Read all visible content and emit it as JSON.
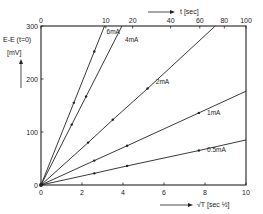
{
  "chart_data": {
    "type": "line",
    "title": "",
    "xlabel": "√T [sec½]",
    "ylabel": "E-E (t=0) [mV]",
    "x2label": "t [sec]",
    "xlim": [
      0,
      10
    ],
    "ylim": [
      0,
      300
    ],
    "x_ticks": [
      0,
      2,
      4,
      6,
      8,
      10
    ],
    "x_tick_labels": [
      "0",
      "2",
      "4",
      "6",
      "8",
      "10"
    ],
    "y_ticks": [
      0,
      100,
      200,
      300
    ],
    "y_tick_labels": [
      "0",
      "100",
      "200",
      "300"
    ],
    "x2_ticks": [
      0,
      10,
      20,
      40,
      60,
      80,
      100
    ],
    "x2_tick_labels": [
      "0",
      "10",
      "20",
      "40",
      "60",
      "80",
      "100"
    ],
    "grid": false,
    "legend": "inline labels",
    "series": [
      {
        "name": "6mA",
        "slope": 97,
        "x": [
          0,
          1.6,
          2.6,
          3.1
        ],
        "y": [
          0,
          155,
          252,
          300
        ],
        "label_pos": [
          3.2,
          285
        ]
      },
      {
        "name": "4mA",
        "slope": 76,
        "x": [
          0,
          1.5,
          2.2,
          3.95
        ],
        "y": [
          0,
          114,
          167,
          300
        ],
        "label_pos": [
          4.1,
          270
        ]
      },
      {
        "name": "2mA",
        "slope": 35,
        "x": [
          0,
          2.3,
          3.5,
          5.2,
          8.5
        ],
        "y": [
          0,
          80,
          123,
          182,
          300
        ],
        "label_pos": [
          5.6,
          190
        ]
      },
      {
        "name": "1mA",
        "slope": 17.7,
        "x": [
          0,
          2.6,
          4.2,
          7.7,
          10
        ],
        "y": [
          0,
          46,
          74,
          136,
          177
        ],
        "label_pos": [
          8.1,
          133
        ]
      },
      {
        "name": "0.5mA",
        "slope": 8.5,
        "x": [
          0,
          2.6,
          4.2,
          7.7,
          10
        ],
        "y": [
          0,
          22,
          36,
          65,
          85
        ],
        "label_pos": [
          8.1,
          62
        ]
      }
    ]
  },
  "labels": {
    "ylabel_line1": "E-E (t=0)",
    "ylabel_line2": "[mV]",
    "xlabel": "√T  [sec ½]",
    "x2label": "t  [sec]"
  }
}
